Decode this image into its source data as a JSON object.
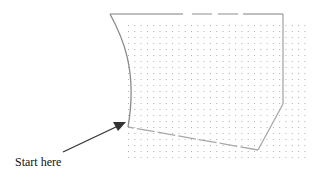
{
  "diagram": {
    "caption": "Start here",
    "colors": {
      "outline": "#a8a8a8",
      "curve": "#8a8a8a",
      "grid_dot": "#b0b0b0",
      "arrow": "#333333",
      "text": "#111111"
    },
    "elements": [
      {
        "name": "dot-grid",
        "description": "dotted grid background"
      },
      {
        "name": "shape-outline",
        "description": "irregular shape with curved left side and partially dashed edges"
      },
      {
        "name": "start-arrow",
        "description": "arrow pointing to the starting corner of the shape"
      }
    ]
  }
}
